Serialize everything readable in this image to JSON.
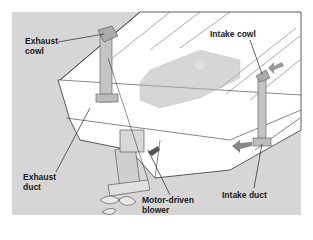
{
  "diagram": {
    "colors": {
      "background_panel": "#d6d6d6",
      "hull": "#ffffff",
      "line": "#333333",
      "component": "#bdbdbd",
      "arrow": "#8a8a8a"
    },
    "labels": {
      "exhaust_cowl": "Exhaust\ncowl",
      "intake_cowl": "Intake cowl",
      "exhaust_duct": "Exhaust\nduct",
      "motor_driven_blower": "Motor-driven\nblower",
      "intake_duct": "Intake duct"
    }
  }
}
